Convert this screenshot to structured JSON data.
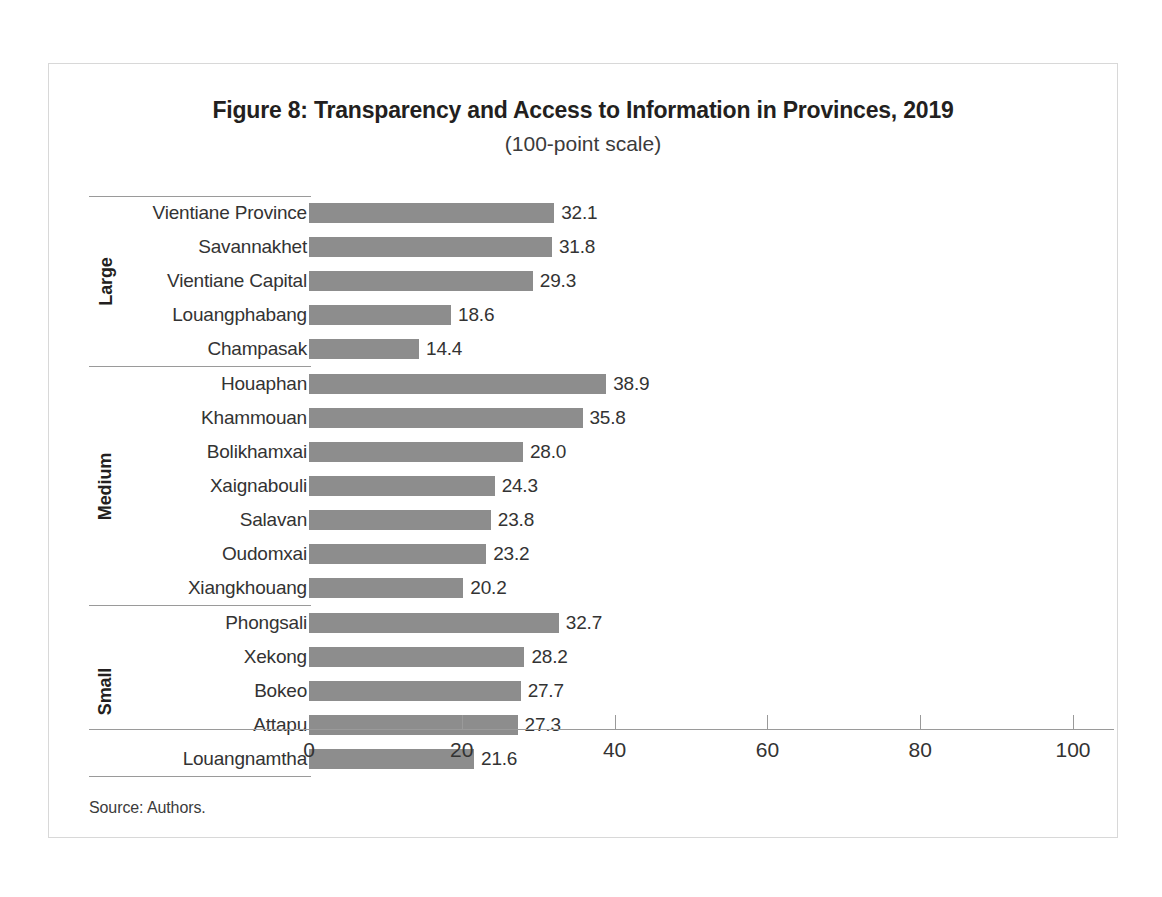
{
  "figure": {
    "title": "Figure 8: Transparency and Access to Information in Provinces, 2019",
    "subtitle": "(100-point scale)",
    "source": "Source: Authors."
  },
  "colors": {
    "bar": "#8d8d8d",
    "axis": "#9a9a9a",
    "text": "#333333",
    "frame": "#d8d8d8"
  },
  "chart_data": {
    "type": "bar",
    "orientation": "horizontal",
    "title": "Figure 8: Transparency and Access to Information in Provinces, 2019",
    "subtitle": "(100-point scale)",
    "xlabel": "",
    "ylabel": "",
    "xlim": [
      0,
      100
    ],
    "xticks": [
      0,
      20,
      40,
      60,
      80,
      100
    ],
    "xticklabels": [
      "0",
      "20",
      "40",
      "60",
      "80",
      "100"
    ],
    "grid": false,
    "legend": null,
    "value_labels": true,
    "categories": [
      "Vientiane Province",
      "Savannakhet",
      "Vientiane Capital",
      "Louangphabang",
      "Champasak",
      "Houaphan",
      "Khammouan",
      "Bolikhamxai",
      "Xaignabouli",
      "Salavan",
      "Oudomxai",
      "Xiangkhouang",
      "Phongsali",
      "Xekong",
      "Bokeo",
      "Attapu",
      "Louangnamtha"
    ],
    "values": [
      32.1,
      31.8,
      29.3,
      18.6,
      14.4,
      38.9,
      35.8,
      28.0,
      24.3,
      23.8,
      23.2,
      20.2,
      32.7,
      28.2,
      27.7,
      27.3,
      21.6
    ],
    "groups": [
      {
        "label": "Large",
        "items": [
          {
            "category": "Vientiane Province",
            "value": 32.1,
            "value_label": "32.1"
          },
          {
            "category": "Savannakhet",
            "value": 31.8,
            "value_label": "31.8"
          },
          {
            "category": "Vientiane Capital",
            "value": 29.3,
            "value_label": "29.3"
          },
          {
            "category": "Louangphabang",
            "value": 18.6,
            "value_label": "18.6"
          },
          {
            "category": "Champasak",
            "value": 14.4,
            "value_label": "14.4"
          }
        ]
      },
      {
        "label": "Medium",
        "items": [
          {
            "category": "Houaphan",
            "value": 38.9,
            "value_label": "38.9"
          },
          {
            "category": "Khammouan",
            "value": 35.8,
            "value_label": "35.8"
          },
          {
            "category": "Bolikhamxai",
            "value": 28.0,
            "value_label": "28.0"
          },
          {
            "category": "Xaignabouli",
            "value": 24.3,
            "value_label": "24.3"
          },
          {
            "category": "Salavan",
            "value": 23.8,
            "value_label": "23.8"
          },
          {
            "category": "Oudomxai",
            "value": 23.2,
            "value_label": "23.2"
          },
          {
            "category": "Xiangkhouang",
            "value": 20.2,
            "value_label": "20.2"
          }
        ]
      },
      {
        "label": "Small",
        "items": [
          {
            "category": "Phongsali",
            "value": 32.7,
            "value_label": "32.7"
          },
          {
            "category": "Xekong",
            "value": 28.2,
            "value_label": "28.2"
          },
          {
            "category": "Bokeo",
            "value": 27.7,
            "value_label": "27.7"
          },
          {
            "category": "Attapu",
            "value": 27.3,
            "value_label": "27.3"
          },
          {
            "category": "Louangnamtha",
            "value": 21.6,
            "value_label": "21.6"
          }
        ]
      }
    ]
  }
}
